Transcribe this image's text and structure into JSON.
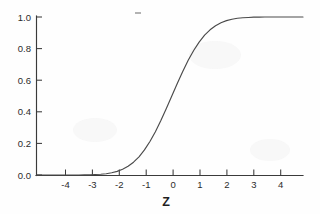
{
  "figure": {
    "background_color": "#fefefe",
    "axis_color": "#3a3a3a",
    "curve_color": "#4a4a4a",
    "artifact_label": "scan-speck"
  },
  "chart_data": {
    "type": "line",
    "title": "",
    "subtitle": "",
    "xlabel": "Z",
    "ylabel": "",
    "xlim": [
      -4.95,
      4.8
    ],
    "ylim": [
      0.0,
      1.0
    ],
    "grid": false,
    "legend": null,
    "xticks": [
      -4,
      -3,
      -2,
      -1,
      0,
      1,
      2,
      3,
      4
    ],
    "xtick_labels": [
      "-4",
      "-3",
      "-2",
      "-1",
      "0",
      "1",
      "2",
      "3",
      "4"
    ],
    "yticks": [
      0.0,
      0.2,
      0.4,
      0.6,
      0.8,
      1.0
    ],
    "ytick_labels": [
      "0.0",
      "0.2",
      "0.4",
      "0.6",
      "0.8",
      "1.0"
    ],
    "series": [
      {
        "name": "Standard normal cumulative distribution",
        "x": [
          -4.95,
          -4.8,
          -4.6,
          -4.4,
          -4.2,
          -4.0,
          -3.8,
          -3.6,
          -3.4,
          -3.2,
          -3.0,
          -2.8,
          -2.6,
          -2.4,
          -2.2,
          -2.0,
          -1.8,
          -1.6,
          -1.4,
          -1.2,
          -1.0,
          -0.8,
          -0.6,
          -0.4,
          -0.2,
          0.0,
          0.2,
          0.4,
          0.6,
          0.8,
          1.0,
          1.2,
          1.4,
          1.6,
          1.8,
          2.0,
          2.2,
          2.4,
          2.6,
          2.8,
          3.0,
          3.2,
          3.4,
          3.6,
          3.8,
          4.0,
          4.2,
          4.4,
          4.6,
          4.8
        ],
        "y": [
          0.0,
          0.0,
          0.0,
          0.0,
          0.0,
          0.0,
          0.0,
          0.0,
          0.0,
          0.001,
          0.001,
          0.003,
          0.005,
          0.008,
          0.014,
          0.023,
          0.036,
          0.055,
          0.081,
          0.115,
          0.159,
          0.212,
          0.274,
          0.345,
          0.421,
          0.5,
          0.579,
          0.655,
          0.726,
          0.788,
          0.841,
          0.885,
          0.919,
          0.945,
          0.964,
          0.977,
          0.986,
          0.992,
          0.995,
          0.997,
          0.999,
          0.999,
          1.0,
          1.0,
          1.0,
          1.0,
          1.0,
          1.0,
          1.0,
          1.0
        ]
      }
    ]
  }
}
